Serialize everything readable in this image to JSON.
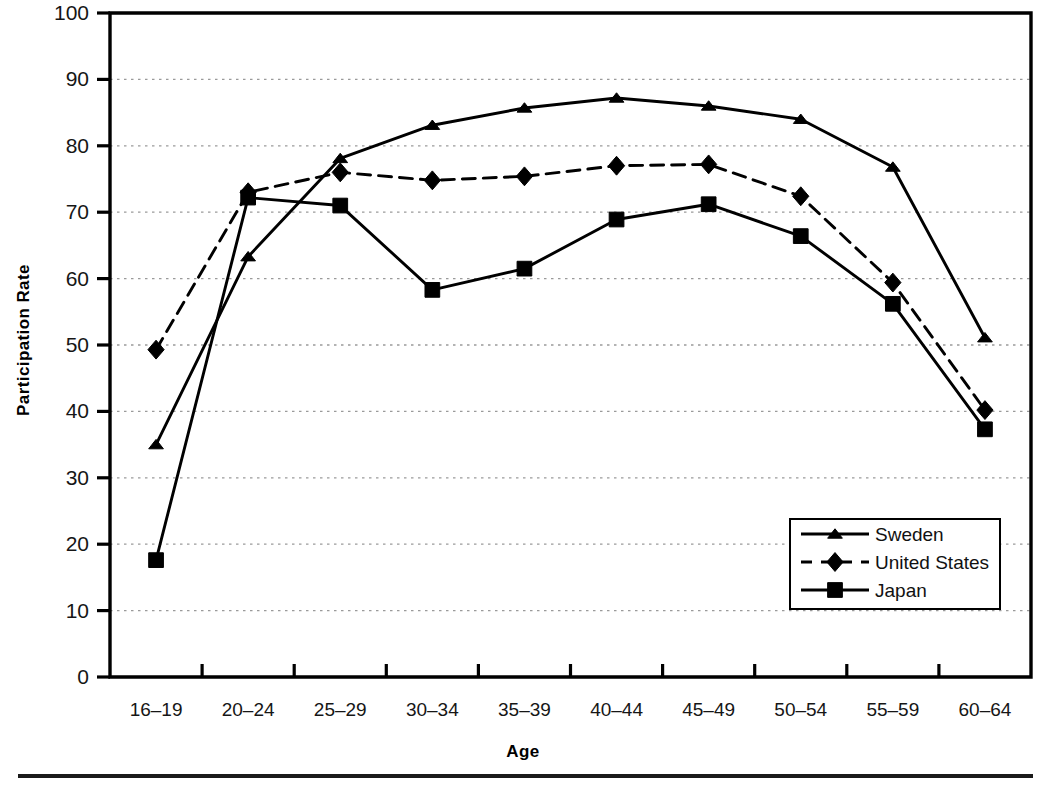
{
  "chart_data": {
    "type": "line",
    "title": "",
    "xlabel": "Age",
    "ylabel": "Participation Rate",
    "categories": [
      "16–19",
      "20–24",
      "25–29",
      "30–34",
      "35–39",
      "40–44",
      "45–49",
      "50–54",
      "55–59",
      "60–64"
    ],
    "ylim": [
      0,
      100
    ],
    "yticks": [
      0,
      10,
      20,
      30,
      40,
      50,
      60,
      70,
      80,
      90,
      100
    ],
    "ytick_labels": [
      "0",
      "10",
      "20",
      "30",
      "40",
      "50",
      "60",
      "70",
      "80",
      "90",
      "100"
    ],
    "grid": true,
    "grid_style": "dotted-horizontal",
    "legend_position": "lower-right-inside",
    "series": [
      {
        "name": "Sweden",
        "marker": "triangle",
        "linestyle": "solid",
        "color": "#000000",
        "values": [
          35.0,
          63.3,
          78.1,
          83.1,
          85.7,
          87.2,
          86.0,
          84.0,
          76.8,
          51.1
        ]
      },
      {
        "name": "United States",
        "marker": "diamond",
        "linestyle": "dashed",
        "color": "#000000",
        "values": [
          49.3,
          73.0,
          76.0,
          74.8,
          75.4,
          77.0,
          77.2,
          72.4,
          59.4,
          40.2
        ]
      },
      {
        "name": "Japan",
        "marker": "square",
        "linestyle": "solid",
        "color": "#000000",
        "values": [
          17.6,
          72.2,
          71.0,
          58.3,
          61.5,
          68.9,
          71.2,
          66.4,
          56.2,
          37.3
        ]
      }
    ]
  },
  "axes": {
    "y_title": "Participation Rate",
    "x_title": "Age"
  },
  "legend": {
    "entries": [
      {
        "label": "Sweden",
        "marker": "triangle",
        "linestyle": "solid"
      },
      {
        "label": "United States",
        "marker": "diamond",
        "linestyle": "dashed"
      },
      {
        "label": "Japan",
        "marker": "square",
        "linestyle": "solid"
      }
    ]
  },
  "colors": {
    "ink": "#000000",
    "grid": "#9a9a9a",
    "background": "#ffffff"
  }
}
